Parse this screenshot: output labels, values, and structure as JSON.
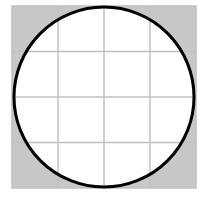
{
  "diagram": {
    "grid": {
      "rows": 4,
      "cols": 4
    },
    "colors": {
      "background": "#ffffff",
      "corner_fill": "#c8c8c8",
      "grid_line": "#c0c0c0",
      "circle_fill": "#ffffff",
      "circle_stroke": "#000000"
    }
  }
}
